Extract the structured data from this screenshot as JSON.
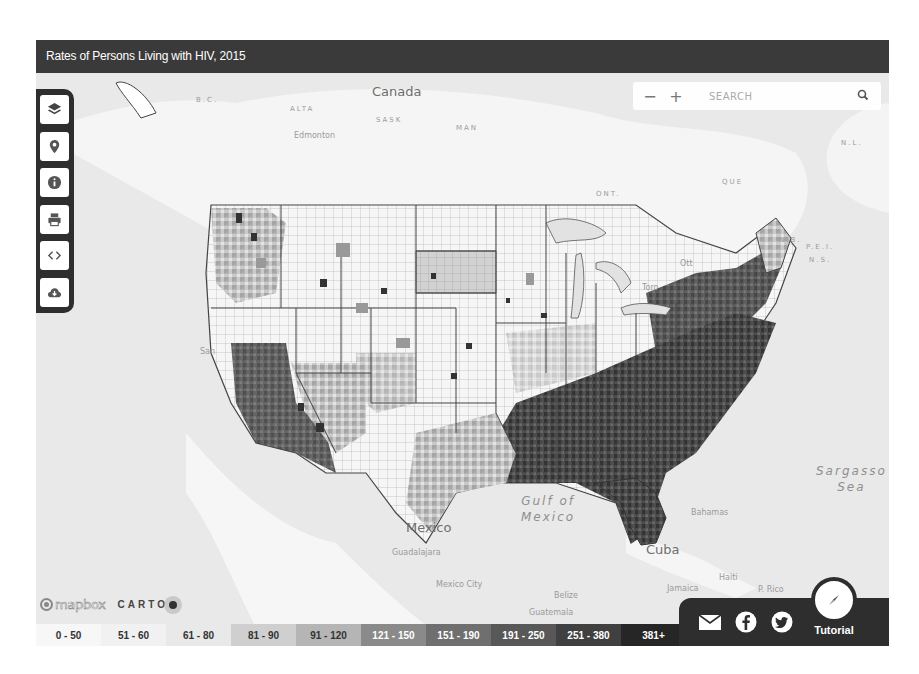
{
  "header": {
    "title": "Rates of Persons Living with HIV, 2015"
  },
  "toolbar": {
    "items": [
      {
        "name": "layers",
        "icon": "layers-icon"
      },
      {
        "name": "location",
        "icon": "map-pin-icon"
      },
      {
        "name": "info",
        "icon": "info-icon"
      },
      {
        "name": "print",
        "icon": "printer-icon"
      },
      {
        "name": "embed",
        "icon": "code-icon"
      },
      {
        "name": "download",
        "icon": "cloud-download-icon"
      }
    ]
  },
  "search": {
    "zoom_out": "−",
    "zoom_in": "+",
    "placeholder": "SEARCH",
    "icon": "search-icon"
  },
  "map_labels": {
    "canada": "Canada",
    "bc": "B.C.",
    "alta": "ALTA",
    "sask": "SASK",
    "man": "MAN",
    "ont": "ONT.",
    "que": "QUE",
    "nl": "N.L.",
    "nb": "N.B.",
    "pei": "P.E.I.",
    "ns": "N.S.",
    "edmonton": "Edmonton",
    "ottawa": "Ott",
    "toronto": "Toro",
    "san": "San",
    "mexico": "Mexico",
    "guadalajara": "Guadalajara",
    "mexico_city": "Mexico City",
    "gulf_line1": "Gulf of",
    "gulf_line2": "Mexico",
    "cuba": "Cuba",
    "bahamas": "Bahamas",
    "haiti": "Haiti",
    "jamaica": "Jamaica",
    "belize": "Belize",
    "guatemala": "Guatemala",
    "puerto_rico": "P. Rico",
    "sargasso_line1": "Sargasso",
    "sargasso_line2": "Sea"
  },
  "attribution": {
    "mapbox": "mapbox",
    "carto": "CARTO"
  },
  "legend": {
    "title": "Rate per 100,000",
    "items": [
      {
        "label": "0 - 50",
        "color": "#f7f7f7",
        "text_color": "#333333"
      },
      {
        "label": "51 - 60",
        "color": "#f1f1f1",
        "text_color": "#333333"
      },
      {
        "label": "61 - 80",
        "color": "#e9e9e9",
        "text_color": "#333333"
      },
      {
        "label": "81 - 90",
        "color": "#cfcfcf",
        "text_color": "#333333"
      },
      {
        "label": "91 - 120",
        "color": "#b5b5b5",
        "text_color": "#333333"
      },
      {
        "label": "121 - 150",
        "color": "#8a8a8a",
        "text_color": "#ffffff"
      },
      {
        "label": "151 - 190",
        "color": "#6f6f6f",
        "text_color": "#ffffff"
      },
      {
        "label": "191 - 250",
        "color": "#585858",
        "text_color": "#ffffff"
      },
      {
        "label": "251 - 380",
        "color": "#404040",
        "text_color": "#ffffff"
      },
      {
        "label": "381+",
        "color": "#262626",
        "text_color": "#ffffff"
      }
    ]
  },
  "share": {
    "email_icon": "envelope-icon",
    "facebook_icon": "facebook-icon",
    "twitter_icon": "twitter-icon",
    "tutorial_label": "Tutorial",
    "tutorial_icon": "compass-icon"
  }
}
